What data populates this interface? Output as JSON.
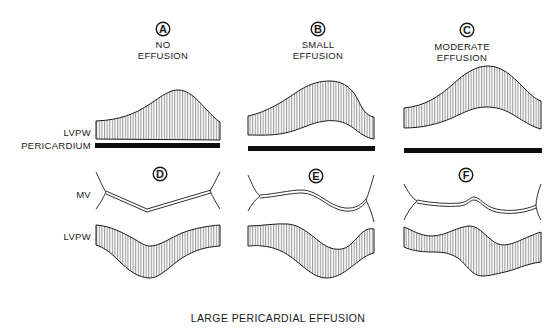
{
  "figure": {
    "faint_top_text": "",
    "caption": "LARGE PERICARDIAL EFFUSION",
    "colors": {
      "ink": "#1a1a1a",
      "background": "#ffffff"
    },
    "row_labels": {
      "top_wall": "LVPW",
      "pericardium": "PERICARDIUM",
      "mitral_valve": "MV",
      "bottom_wall": "LVPW"
    },
    "panels_top": [
      {
        "letter": "A",
        "title_line1": "NO",
        "title_line2": "EFFUSION"
      },
      {
        "letter": "B",
        "title_line1": "SMALL",
        "title_line2": "EFFUSION"
      },
      {
        "letter": "C",
        "title_line1": "MODERATE",
        "title_line2": "EFFUSION"
      }
    ],
    "panels_bottom": [
      {
        "letter": "D"
      },
      {
        "letter": "E"
      },
      {
        "letter": "F"
      }
    ]
  }
}
